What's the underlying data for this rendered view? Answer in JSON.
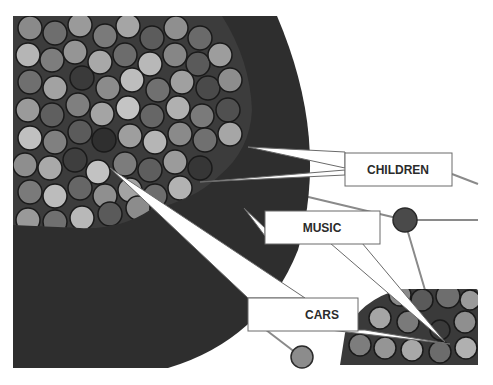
{
  "diagram": {
    "background": "#ffffff",
    "big_cluster": {
      "fill": "#2e2e2e"
    },
    "small_cluster": {
      "fill": "#3a3a3a"
    },
    "edge_color": "#8a8a8a",
    "callouts": [
      {
        "id": "children",
        "label": "CHILDREN"
      },
      {
        "id": "music",
        "label": "MUSIC"
      },
      {
        "id": "cars",
        "label": "CARS"
      }
    ],
    "nodes": [
      {
        "id": "node-mid-right",
        "fill": "#4a4a4a"
      },
      {
        "id": "node-bottom",
        "fill": "#8c8c8c"
      }
    ]
  }
}
